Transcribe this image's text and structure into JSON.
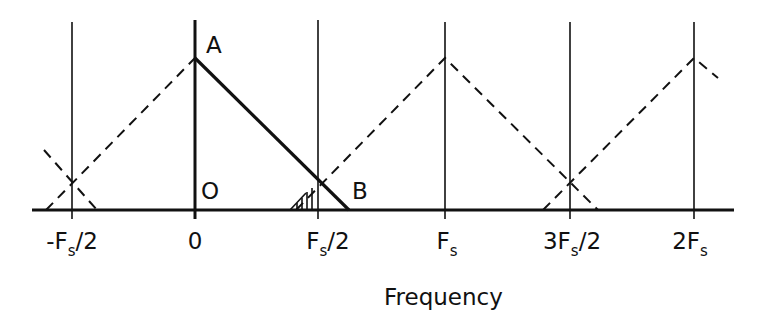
{
  "diagram": {
    "xlabel": "Frequency",
    "point_labels": {
      "A": "A",
      "B": "B",
      "O": "O"
    },
    "ticks": [
      {
        "pre": "-F",
        "sub": "s",
        "post": "/2",
        "x": 72
      },
      {
        "pre": "0",
        "sub": "",
        "post": "",
        "x": 195
      },
      {
        "pre": "F",
        "sub": "s",
        "post": "/2",
        "x": 318
      },
      {
        "pre": "F",
        "sub": "s",
        "post": "",
        "x": 445
      },
      {
        "pre": "3F",
        "sub": "s",
        "post": "/2",
        "x": 570
      },
      {
        "pre": "2F",
        "sub": "s",
        "post": "",
        "x": 694
      }
    ],
    "colors": {
      "ink": "#111111",
      "background": "#ffffff"
    }
  }
}
